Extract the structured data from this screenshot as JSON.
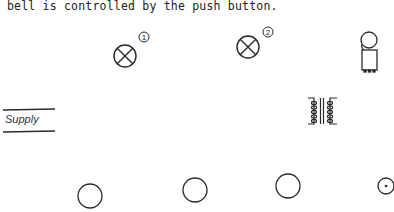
{
  "caption": {
    "text": "bell is controlled by the push button."
  },
  "supply": {
    "label": "Supply"
  },
  "components": {
    "lamp_1": {
      "type": "lamp",
      "number": "1",
      "cx": 125,
      "cy": 56,
      "r": 11
    },
    "lamp_2": {
      "type": "lamp",
      "number": "2",
      "cx": 248,
      "cy": 47,
      "r": 11
    },
    "bell": {
      "type": "bell",
      "cx": 369,
      "cy": 40
    },
    "transformer": {
      "type": "transformer",
      "x": 308,
      "y": 97
    },
    "terminals": [
      {
        "name": "terminal-1",
        "cx": 90,
        "cy": 196,
        "r": 12
      },
      {
        "name": "terminal-2",
        "cx": 195,
        "cy": 190,
        "r": 12
      },
      {
        "name": "terminal-3",
        "cx": 288,
        "cy": 186,
        "r": 12
      }
    ],
    "push_button": {
      "type": "push-button",
      "cx": 386,
      "cy": 186,
      "r": 8
    }
  },
  "colors": {
    "stroke": "#2a2a2a",
    "background": "#ffffff"
  }
}
